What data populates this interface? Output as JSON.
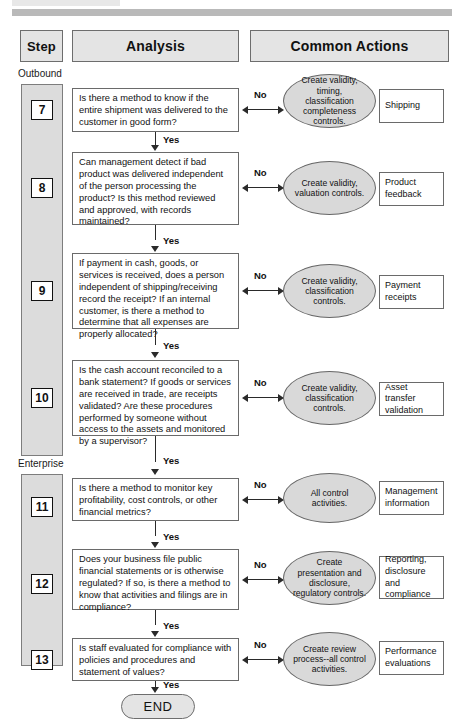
{
  "decorations": {
    "top_block": "",
    "top_bar": ""
  },
  "header": {
    "step_label": "Step",
    "analysis_label": "Analysis",
    "actions_label": "Common Actions"
  },
  "sections": [
    {
      "label": "Outbound"
    },
    {
      "label": "Enterprise"
    }
  ],
  "end": {
    "label": "END"
  },
  "connector": {
    "yes_label": "Yes",
    "no_label": "No"
  },
  "rows": [
    {
      "step": "7",
      "question": "Is there a method to know if the entire shipment was delivered to the customer in good form?",
      "no_label": "No",
      "action": "Create validity, timing, classification completeness controls.",
      "outcome": "Shipping",
      "yes_label": "Yes"
    },
    {
      "step": "8",
      "question": "Can management detect if bad product was delivered independent of the person processing the product? Is this method reviewed and approved, with records maintained?",
      "no_label": "No",
      "action": "Create validity, valuation controls.",
      "outcome": "Product feedback",
      "yes_label": "Yes"
    },
    {
      "step": "9",
      "question": "If payment in cash, goods, or services is received, does a person independent of shipping/receiving record the receipt? If an internal customer, is there a method to determine that all expenses are properly allocated?",
      "no_label": "No",
      "action": "Create validity, classification controls.",
      "outcome": "Payment receipts",
      "yes_label": "Yes"
    },
    {
      "step": "10",
      "question": "Is the cash account reconciled to a bank statement? If goods or services are received in trade, are receipts validated?  Are these procedures performed by someone without access to the assets and monitored by a supervisor?",
      "no_label": "No",
      "action": "Create validity, classification controls.",
      "outcome": "Asset transfer validation",
      "yes_label": "Yes"
    },
    {
      "step": "11",
      "question": "Is there a method to monitor key profitability, cost controls, or other financial metrics?",
      "no_label": "No",
      "action": "All control activities.",
      "outcome": "Management information",
      "yes_label": "Yes"
    },
    {
      "step": "12",
      "question": "Does your business file public financial statements or is otherwise regulated? If so, is there a method to know that activities and filings are in compliance?",
      "no_label": "No",
      "action": "Create presentation and disclosure, regulatory controls.",
      "outcome": "Reporting, disclosure and compliance",
      "yes_label": "Yes"
    },
    {
      "step": "13",
      "question": "Is staff evaluated for compliance with policies and procedures and statement of values?",
      "no_label": "No",
      "action": "Create review process--all control activities.",
      "outcome": "Performance evaluations",
      "yes_label": "Yes"
    }
  ]
}
